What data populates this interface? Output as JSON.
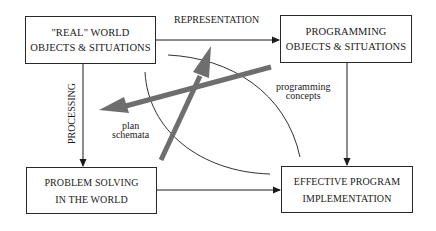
{
  "diagram": {
    "boxes": {
      "real_world": {
        "line1": "\"REAL\" WORLD",
        "line2": "OBJECTS & SITUATIONS"
      },
      "programming": {
        "line1": "PROGRAMMING",
        "line2": "OBJECTS & SITUATIONS"
      },
      "problem_solving": {
        "line1": "PROBLEM SOLVING",
        "line2": "IN THE WORLD"
      },
      "implementation": {
        "line1": "EFFECTIVE PROGRAM",
        "line2": "IMPLEMENTATION"
      }
    },
    "edge_labels": {
      "representation": "REPRESENTATION",
      "processing": "PROCESSING"
    },
    "region_labels": {
      "programming_concepts": {
        "line1": "programming",
        "line2": "concepts"
      },
      "plan_schemata": {
        "line1": "plan",
        "line2": "schemata"
      }
    },
    "colors": {
      "line": "#1a1a1a",
      "thick_arrow": "#6e6e6e"
    }
  }
}
